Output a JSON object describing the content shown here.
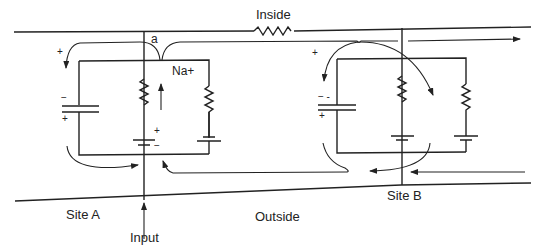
{
  "labels": {
    "inside": "Inside",
    "outside": "Outside",
    "site_a": "Site A",
    "site_b": "Site B",
    "input": "Input",
    "node_a": "a",
    "sodium": "Na+"
  },
  "signs": {
    "siteA_cap_top": "−",
    "siteA_cap_bottom": "+",
    "siteA_flow_plus": "+",
    "siteA_battery_plus": "+",
    "siteA_battery_minus": "−",
    "siteB_cap_top": "− -",
    "siteB_cap_bottom": "+",
    "siteB_flow_plus": "+"
  },
  "colors": {
    "line": "#222222",
    "background": "#ffffff"
  }
}
